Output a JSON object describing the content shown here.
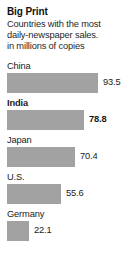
{
  "headline": "Big Print",
  "subhead_lines": [
    "Countries with the most",
    "daily-newspaper sales.",
    "in millions of copies"
  ],
  "colors": {
    "bar": "#a2a2a2",
    "text": "#1a1a1a",
    "background": "#ffffff"
  },
  "chart_data": {
    "type": "bar",
    "orientation": "horizontal",
    "title": "Big Print",
    "subtitle": "Countries with the most daily-newspaper sales. in millions of copies",
    "xlabel": "",
    "ylabel": "",
    "unit": "millions of copies",
    "categories": [
      "China",
      "India",
      "Japan",
      "U.S.",
      "Germany"
    ],
    "values": [
      93.5,
      78.8,
      70.4,
      55.6,
      22.1
    ],
    "value_labels": [
      "93.5",
      "78.8",
      "70.4",
      "55.6",
      "22.1"
    ],
    "highlighted": [
      "India"
    ],
    "xlim": [
      0,
      93.5
    ],
    "grid": false,
    "legend": false
  },
  "bars": [
    {
      "label": "China",
      "value_label": "93.5",
      "width_px": 91,
      "bold": false
    },
    {
      "label": "India",
      "value_label": "78.8",
      "width_px": 77,
      "bold": true
    },
    {
      "label": "Japan",
      "value_label": "70.4",
      "width_px": 68,
      "bold": false
    },
    {
      "label": "U.S.",
      "value_label": "55.6",
      "width_px": 54,
      "bold": false
    },
    {
      "label": "Germany",
      "value_label": "22.1",
      "width_px": 22,
      "bold": false
    }
  ]
}
